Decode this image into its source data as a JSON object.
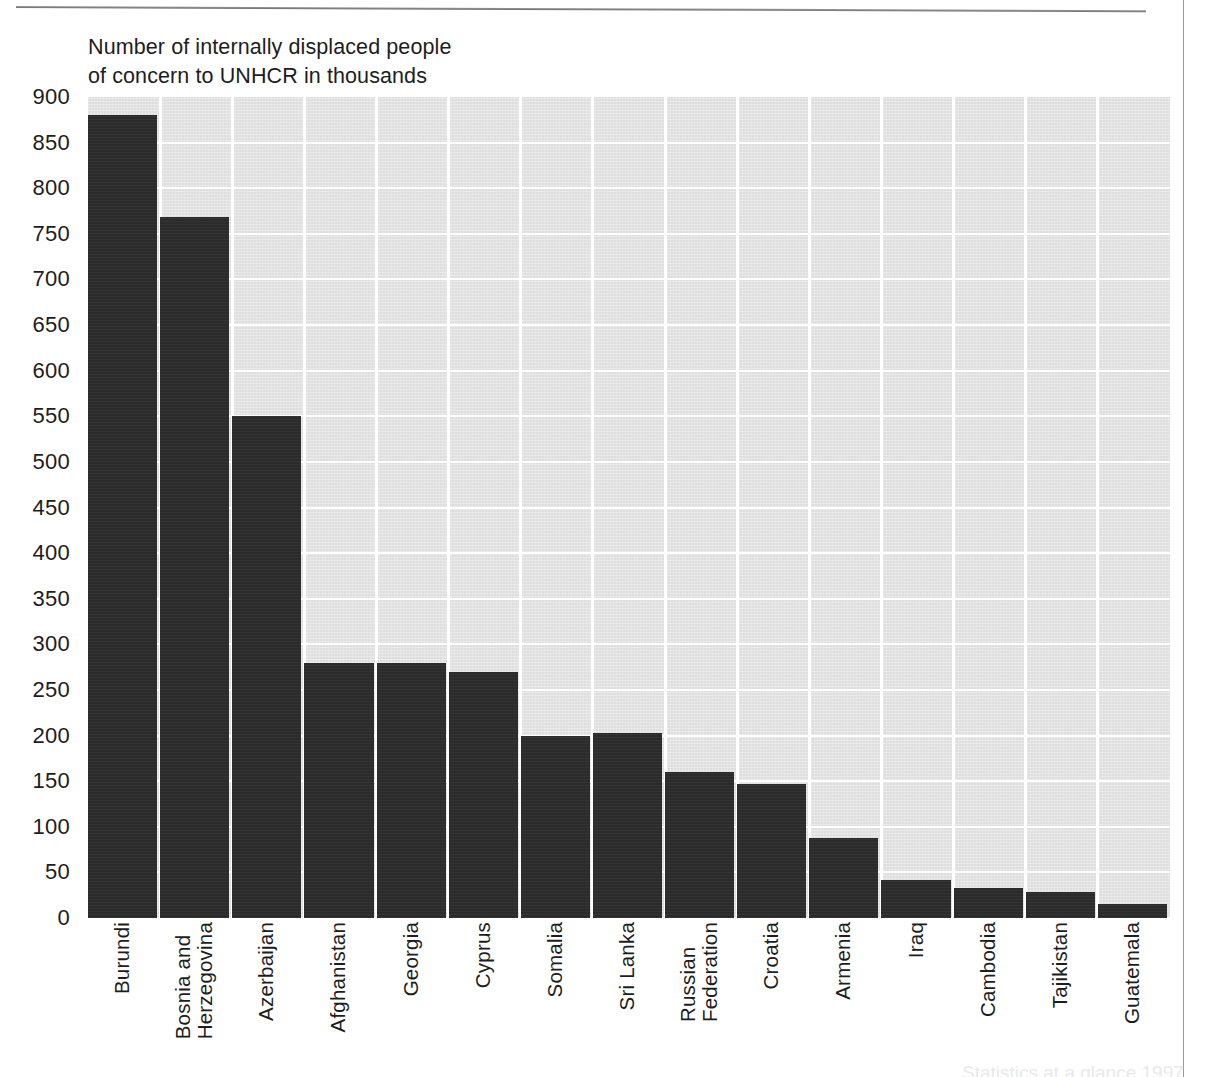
{
  "chart_data": {
    "type": "bar",
    "title": "Number of internally displaced people of concern to UNHCR in thousands",
    "title_lines": [
      "Number of internally displaced people",
      "of concern to UNHCR in thousands"
    ],
    "xlabel": "",
    "ylabel": "Number of internally displaced people of concern to UNHCR in thousands",
    "ylim": [
      0,
      900
    ],
    "ytick_step": 50,
    "yticks": [
      900,
      850,
      800,
      750,
      700,
      650,
      600,
      550,
      500,
      450,
      400,
      350,
      300,
      250,
      200,
      150,
      100,
      50,
      0
    ],
    "ytick_labels": [
      "900",
      "850",
      "800",
      "750",
      "700",
      "650",
      "600",
      "550",
      "500",
      "450",
      "400",
      "350",
      "300",
      "250",
      "200",
      "150",
      "100",
      "50",
      "0"
    ],
    "grid": true,
    "grid_orientation": "both",
    "legend": null,
    "categories": [
      "Burundi",
      "Bosnia and Herzegovina",
      "Azerbaijan",
      "Afghanistan",
      "Georgia",
      "Cyprus",
      "Somalia",
      "Sri Lanka",
      "Russian Federation",
      "Croatia",
      "Armenia",
      "Iraq",
      "Cambodia",
      "Tajikistan",
      "Guatemala"
    ],
    "category_label_lines": [
      [
        "Burundi"
      ],
      [
        "Bosnia and",
        "Herzegovina"
      ],
      [
        "Azerbaijan"
      ],
      [
        "Afghanistan"
      ],
      [
        "Georgia"
      ],
      [
        "Cyprus"
      ],
      [
        "Somalia"
      ],
      [
        "Sri Lanka"
      ],
      [
        "Russian",
        "Federation"
      ],
      [
        "Croatia"
      ],
      [
        "Armenia"
      ],
      [
        "Iraq"
      ],
      [
        "Cambodia"
      ],
      [
        "Tajikistan"
      ],
      [
        "Guatemala"
      ]
    ],
    "values": [
      880,
      768,
      550,
      280,
      280,
      270,
      200,
      203,
      160,
      147,
      88,
      42,
      33,
      29,
      15
    ],
    "units": "thousands",
    "bar_color": "#2b2b2b",
    "plot_background_color": "#dedede",
    "gridline_color": "#ffffff",
    "text_color": "#1d1d1d"
  },
  "page": {
    "footer_ghost": "Statistics at a glance 1997"
  }
}
